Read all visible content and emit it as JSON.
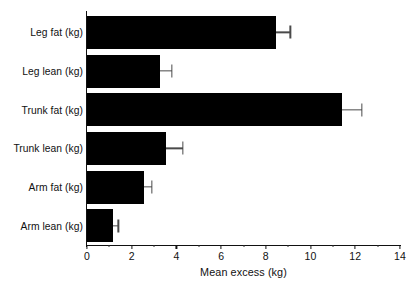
{
  "chart_data": {
    "type": "bar",
    "orientation": "horizontal",
    "title": "",
    "xlabel": "Mean excess (kg)",
    "ylabel": "",
    "xlim": [
      0,
      14
    ],
    "xticks": [
      0,
      2,
      4,
      6,
      8,
      10,
      12,
      14
    ],
    "xtick_labels": [
      "0",
      "2",
      "4",
      "6",
      "8",
      "10",
      "12",
      "14"
    ],
    "minor_tick_interval": 1,
    "grid": false,
    "legend": false,
    "bar_color": "#000000",
    "errorbar_color": "#4a4a4a",
    "categories": [
      "Leg fat (kg)",
      "Leg lean (kg)",
      "Trunk fat (kg)",
      "Trunk lean (kg)",
      "Arm fat (kg)",
      "Arm lean (kg)"
    ],
    "values": [
      8.45,
      3.25,
      11.4,
      3.55,
      2.55,
      1.15
    ],
    "error_upper": [
      0.65,
      0.55,
      0.9,
      0.75,
      0.35,
      0.25
    ],
    "bars": [
      {
        "category": "Leg fat (kg)",
        "value": 8.45,
        "error_upper": 0.65,
        "error_high": 9.1
      },
      {
        "category": "Leg lean (kg)",
        "value": 3.25,
        "error_upper": 0.55,
        "error_high": 3.8
      },
      {
        "category": "Trunk fat (kg)",
        "value": 11.4,
        "error_upper": 0.9,
        "error_high": 12.3
      },
      {
        "category": "Trunk lean (kg)",
        "value": 3.55,
        "error_upper": 0.75,
        "error_high": 4.3
      },
      {
        "category": "Arm fat (kg)",
        "value": 2.55,
        "error_upper": 0.35,
        "error_high": 2.9
      },
      {
        "category": "Arm lean (kg)",
        "value": 1.15,
        "error_upper": 0.25,
        "error_high": 1.4
      }
    ]
  }
}
